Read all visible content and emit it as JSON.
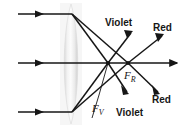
{
  "figure": {
    "name": "chromatic-aberration-converging-lens",
    "background_color": "#ffffff",
    "line_color": "#161616",
    "lens_fill_color": "#e8e8e8",
    "width": 181,
    "height": 126
  },
  "labels": {
    "violet_top": "Violet",
    "red_top": "Red",
    "red_bottom": "Red",
    "violet_bottom": "Violet",
    "focus_red": "F",
    "focus_red_sub": "R",
    "focus_violet": "F",
    "focus_violet_sub": "V"
  },
  "geometry": {
    "optical_axis": {
      "x1": 18,
      "y1": 63,
      "x2": 178,
      "y2": 63
    },
    "incident_rays": [
      {
        "x1": 18,
        "y1": 14,
        "x2": 72,
        "y2": 14
      },
      {
        "x1": 18,
        "y1": 63,
        "x2": 72,
        "y2": 63
      },
      {
        "x1": 18,
        "y1": 112,
        "x2": 72,
        "y2": 112
      }
    ],
    "focus_violet_point": {
      "x": 108,
      "y": 63
    },
    "focus_red_point": {
      "x": 128,
      "y": 63
    },
    "lens": {
      "cx": 71,
      "top_y": 4,
      "bottom_y": 124,
      "half_width": 9
    }
  }
}
